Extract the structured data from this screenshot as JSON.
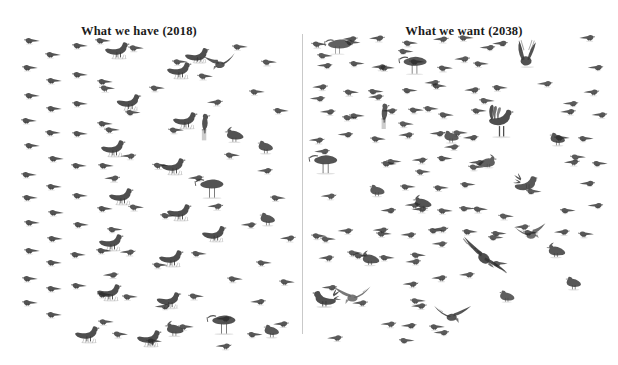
{
  "figure": {
    "caption_left": "What we have (2018)",
    "caption_right": "What we want (2038)",
    "divider_color": "#c9c9c9",
    "background_color": "#ffffff",
    "ink_color": "#2b2b2b"
  },
  "panels": [
    {
      "id": "have-2018",
      "title": "What we have (2018)",
      "year": "2018"
    },
    {
      "id": "want-2038",
      "title": "What we want (2038)",
      "year": "2038"
    }
  ],
  "chart_data": {
    "type": "pictogram",
    "subtitle": "",
    "xlabel": "",
    "ylabel": "",
    "legend_position": "none",
    "grid": false,
    "categories": [
      "What we have (2018)",
      "What we want (2038)"
    ],
    "unit": "one icon = one bird",
    "series": [
      {
        "name": "small moorland songbirds (meadow pipit / skylark type)",
        "icon": "small-bird-icon",
        "values": [
          96,
          150
        ]
      },
      {
        "name": "red grouse",
        "icon": "grouse-icon",
        "values": [
          16,
          8
        ]
      },
      {
        "name": "curlew",
        "icon": "curlew-icon",
        "values": [
          2,
          3
        ]
      },
      {
        "name": "lapwing",
        "icon": "lapwing-icon",
        "values": [
          2,
          4
        ]
      },
      {
        "name": "golden plover",
        "icon": "plover-icon",
        "values": [
          2,
          5
        ]
      },
      {
        "name": "gull in flight",
        "icon": "gull-icon",
        "values": [
          1,
          1
        ]
      },
      {
        "name": "kestrel on post",
        "icon": "kestrel-icon",
        "values": [
          1,
          1
        ]
      },
      {
        "name": "black grouse",
        "icon": "blackgrouse-icon",
        "values": [
          0,
          2
        ]
      },
      {
        "name": "hen harrier",
        "icon": "harrier-icon",
        "values": [
          0,
          2
        ]
      },
      {
        "name": "golden eagle",
        "icon": "eagle-icon",
        "values": [
          0,
          1
        ]
      },
      {
        "name": "short-eared owl",
        "icon": "owl-icon",
        "values": [
          0,
          1
        ]
      }
    ],
    "totals": [
      120,
      178
    ]
  }
}
